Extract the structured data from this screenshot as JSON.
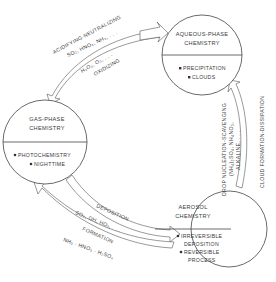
{
  "nodes": {
    "gas": {
      "title_1": "GAS-PHASE",
      "title_2": "CHEMISTRY",
      "items": [
        "PHOTOCHEMISTRY",
        "NIGHTTIME"
      ]
    },
    "aqueous": {
      "title_1": "AQUEOUS-PHASE",
      "title_2": "CHEMISTRY",
      "items": [
        "PRECIPITATION",
        "CLOUDS"
      ]
    },
    "aerosol": {
      "title_1": "AEROSOL",
      "title_2": "CHEMISTRY",
      "items": [
        "IRREVERSIBLE",
        "DEPOSITION",
        "REVERSIBLE",
        "PROCESS"
      ]
    }
  },
  "edges": {
    "gas_aqueous": {
      "outer_1": "ACIDIFYING-NEUTRALIZING",
      "outer_2": "SO₂, HNO₃, NH₃, . . .",
      "inner_1": "H₂O₂, O₃, . . .",
      "inner_2": "OXIDIZING"
    },
    "aqueous_aerosol": {
      "inner_1": "DROP NUCLEATION-SCAVENGING",
      "inner_2": "(NH₄)₂SO₄, NH₄NO₃,",
      "inner_3": "ALKALINE, . . .",
      "outer_1": "CLOUD FORMATION-DISSIPATION"
    },
    "gas_aerosol": {
      "label_1": "DEPOSITION",
      "label_2": "SO₂, OH, HO₂, . . .",
      "label_3": "FORMATION",
      "label_4": "NH₃ · HNO₃ · H₂SO₄"
    }
  },
  "colors": {
    "line": "#444444",
    "text": "#3a3a3a",
    "background": "#ffffff"
  }
}
